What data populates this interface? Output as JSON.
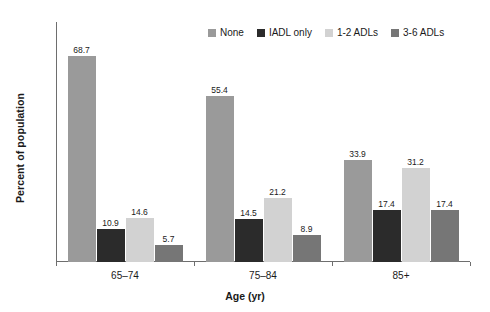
{
  "chart_data": {
    "type": "bar",
    "title": "",
    "xlabel": "Age (yr)",
    "ylabel": "Percent of population",
    "categories": [
      "65–74",
      "75–84",
      "85+"
    ],
    "ylim": [
      0,
      80
    ],
    "yticks": [
      0,
      10,
      20,
      30,
      40,
      50,
      60,
      70,
      80
    ],
    "ytick_labels": [
      "0",
      "10",
      "20",
      "30",
      "40",
      "50",
      "60",
      "70",
      "80"
    ],
    "grid": false,
    "legend_position": "top-right",
    "value_labels": true,
    "series": [
      {
        "name": "None",
        "color": "#9a9a9a",
        "values": [
          68.7,
          55.4,
          33.9
        ],
        "labels": [
          "68.7",
          "55.4",
          "33.9"
        ]
      },
      {
        "name": "IADL only",
        "color": "#2b2b2b",
        "values": [
          10.9,
          14.5,
          17.4
        ],
        "labels": [
          "10.9",
          "14.5",
          "17.4"
        ]
      },
      {
        "name": "1-2 ADLs",
        "color": "#d2d2d2",
        "values": [
          14.6,
          21.2,
          31.2
        ],
        "labels": [
          "14.6",
          "21.2",
          "31.2"
        ]
      },
      {
        "name": "3-6 ADLs",
        "color": "#767676",
        "values": [
          5.7,
          8.9,
          17.4
        ],
        "labels": [
          "5.7",
          "8.9",
          "17.4"
        ]
      }
    ]
  },
  "colors": {
    "axis": "#6e6e6e",
    "text": "#1a1a1a",
    "background": "#ffffff"
  }
}
